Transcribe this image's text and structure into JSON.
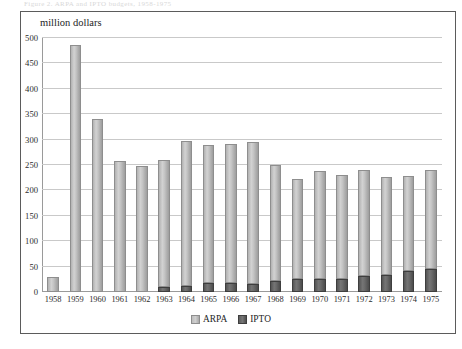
{
  "top_strip_text": "Figure 2. ARPA and IPTO budgets, 1958-1975",
  "chart_data": {
    "type": "bar",
    "subtype": "stacked-column",
    "title": "",
    "xlabel": "",
    "ylabel": "million dollars",
    "ylim": [
      0,
      500
    ],
    "ytick_step": 50,
    "yticks": [
      500,
      450,
      400,
      350,
      300,
      250,
      200,
      150,
      100,
      50,
      0
    ],
    "grid": true,
    "grid_axis": "y",
    "legend_position": "bottom-center",
    "categories": [
      "1958",
      "1959",
      "1960",
      "1961",
      "1962",
      "1963",
      "1964",
      "1965",
      "1966",
      "1967",
      "1968",
      "1969",
      "1970",
      "1971",
      "1972",
      "1973",
      "1974",
      "1975"
    ],
    "series": [
      {
        "name": "ARPA",
        "color": "#c4c4c4",
        "values": [
          30,
          487,
          340,
          258,
          248,
          250,
          285,
          272,
          275,
          280,
          230,
          198,
          213,
          205,
          210,
          193,
          188,
          195
        ]
      },
      {
        "name": "IPTO",
        "color": "#626262",
        "values": [
          0,
          0,
          0,
          0,
          0,
          9,
          12,
          17,
          17,
          16,
          21,
          25,
          26,
          26,
          31,
          33,
          41,
          45
        ]
      }
    ]
  },
  "legend": {
    "items": [
      {
        "label": "ARPA",
        "swatch": "swatch-arpa"
      },
      {
        "label": "IPTO",
        "swatch": "swatch-ipto"
      }
    ]
  }
}
